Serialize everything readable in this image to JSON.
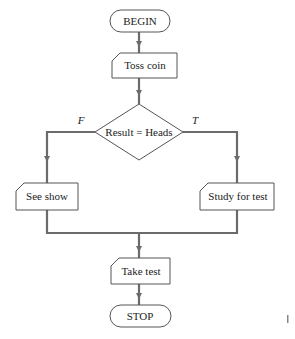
{
  "diagram": {
    "type": "flowchart",
    "nodes": {
      "begin": {
        "kind": "terminator",
        "label": "BEGIN"
      },
      "toss": {
        "kind": "process",
        "label": "Toss coin"
      },
      "decision": {
        "kind": "decision",
        "label": "Result = Heads"
      },
      "see_show": {
        "kind": "process",
        "label": "See show"
      },
      "study": {
        "kind": "process",
        "label": "Study for test"
      },
      "take_test": {
        "kind": "process",
        "label": "Take test"
      },
      "stop": {
        "kind": "terminator",
        "label": "STOP"
      }
    },
    "branches": {
      "false_label": "F",
      "true_label": "T"
    },
    "edges": [
      {
        "from": "begin",
        "to": "toss"
      },
      {
        "from": "toss",
        "to": "decision"
      },
      {
        "from": "decision",
        "to": "see_show",
        "label": "F"
      },
      {
        "from": "decision",
        "to": "study",
        "label": "T"
      },
      {
        "from": "see_show",
        "to": "take_test"
      },
      {
        "from": "study",
        "to": "take_test"
      },
      {
        "from": "take_test",
        "to": "stop"
      }
    ]
  }
}
